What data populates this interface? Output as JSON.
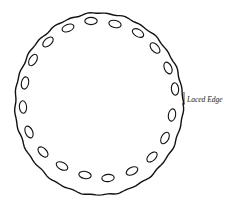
{
  "diagram": {
    "label": "Laced Edge",
    "label_pos": {
      "x": 187,
      "y": 95
    },
    "stroke_color": "#111111",
    "background": "#ffffff",
    "circle": {
      "cx": 99,
      "cy": 104,
      "r": 85
    },
    "holes": [
      {
        "x": 91,
        "y": 21,
        "angle": 0
      },
      {
        "x": 115,
        "y": 24,
        "angle": 12
      },
      {
        "x": 138,
        "y": 33,
        "angle": 30
      },
      {
        "x": 155,
        "y": 48,
        "angle": 48
      },
      {
        "x": 168,
        "y": 68,
        "angle": 66
      },
      {
        "x": 175,
        "y": 89,
        "angle": 84
      },
      {
        "x": 172,
        "y": 115,
        "angle": 100
      },
      {
        "x": 165,
        "y": 138,
        "angle": 118
      },
      {
        "x": 152,
        "y": 157,
        "angle": 136
      },
      {
        "x": 132,
        "y": 171,
        "angle": 154
      },
      {
        "x": 108,
        "y": 178,
        "angle": 174
      },
      {
        "x": 85,
        "y": 175,
        "angle": 190
      },
      {
        "x": 62,
        "y": 166,
        "angle": 208
      },
      {
        "x": 43,
        "y": 152,
        "angle": 226
      },
      {
        "x": 29,
        "y": 132,
        "angle": 246
      },
      {
        "x": 23,
        "y": 107,
        "angle": 266
      },
      {
        "x": 25,
        "y": 83,
        "angle": 282
      },
      {
        "x": 33,
        "y": 60,
        "angle": 300
      },
      {
        "x": 48,
        "y": 42,
        "angle": 318
      },
      {
        "x": 68,
        "y": 28,
        "angle": 338
      }
    ]
  }
}
